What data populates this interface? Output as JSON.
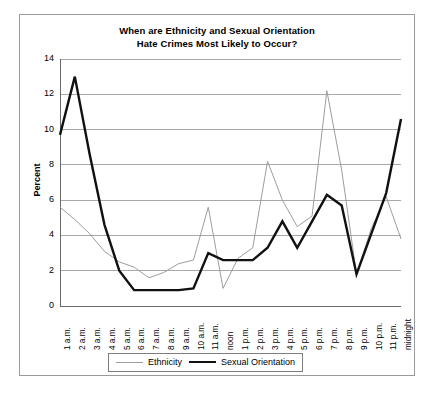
{
  "chart_data": {
    "type": "line",
    "title": "When are Ethnicity and Sexual Orientation Hate Crimes Most Likely to Occur?",
    "title_line1": "When are Ethnicity and Sexual Orientation",
    "title_line2": "Hate Crimes Most Likely to Occur?",
    "xlabel": "",
    "ylabel": "Percent",
    "ylim": [
      0,
      14
    ],
    "yticks": [
      0,
      2,
      4,
      6,
      8,
      10,
      12,
      14
    ],
    "grid": true,
    "legend_position": "bottom",
    "categories": [
      "1 a.m.",
      "2 a.m.",
      "3 a.m.",
      "4 a.m.",
      "5 a.m.",
      "6 a.m.",
      "7 a.m.",
      "8 a.m.",
      "9 a.m.",
      "10 a.m.",
      "11 a.m.",
      "noon",
      "1 p.m.",
      "2 p.m.",
      "3 p.m.",
      "4 p.m.",
      "5 p.m.",
      "6 p.m.",
      "7 p.m.",
      "8 p.m.",
      "9 p.m.",
      "10 p.m.",
      "11 p.m.",
      "midnight"
    ],
    "series": [
      {
        "name": "Ethnicity",
        "color": "#9d9d9d",
        "width": 1.0,
        "values": [
          5.6,
          4.9,
          4.1,
          3.1,
          2.5,
          2.2,
          1.6,
          1.9,
          2.4,
          2.6,
          5.6,
          1.0,
          2.7,
          3.3,
          8.2,
          6.0,
          4.5,
          5.1,
          12.2,
          7.7,
          1.8,
          4.4,
          6.2,
          3.8
        ]
      },
      {
        "name": "Sexual Orientation",
        "color": "#111111",
        "width": 2.4,
        "values": [
          9.7,
          13.0,
          8.6,
          4.6,
          2.0,
          0.9,
          0.9,
          0.9,
          0.9,
          1.0,
          3.0,
          2.6,
          2.6,
          2.6,
          3.3,
          4.8,
          3.3,
          4.8,
          6.3,
          5.7,
          1.8,
          4.1,
          6.4,
          10.6
        ]
      }
    ]
  },
  "legend": {
    "items": [
      {
        "label": "Ethnicity"
      },
      {
        "label": "Sexual Orientation"
      }
    ]
  }
}
